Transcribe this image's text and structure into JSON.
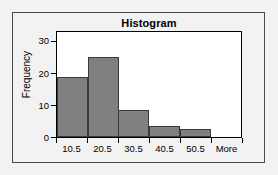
{
  "chart_data": {
    "type": "bar",
    "title": "Histogram",
    "xlabel": "",
    "ylabel": "Frequency",
    "categories": [
      "10.5",
      "20.5",
      "30.5",
      "40.5",
      "50.5",
      "More"
    ],
    "values": [
      19,
      25,
      8.5,
      3.5,
      2.5,
      0
    ],
    "ylim": [
      0,
      33
    ],
    "yticks": [
      0,
      10,
      20,
      30
    ],
    "ytick_labels": [
      "0",
      "10",
      "20",
      "30"
    ],
    "xtick_labels": [
      "10.5",
      "20.5",
      "30.5",
      "40.5",
      "50.5",
      "More"
    ],
    "grid": false,
    "legend": null,
    "bar_fill_color": "#808080",
    "bar_edge_color": "#3a3a3a",
    "plot_background": "#ffffff",
    "frame_background": "#f2f2f2",
    "axis_color": "#000000"
  }
}
